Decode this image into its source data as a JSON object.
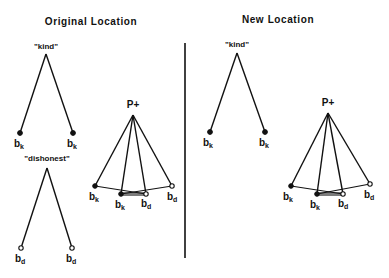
{
  "panels": {
    "left": {
      "title": "Original Location",
      "trees": [
        {
          "root_label": "\"kind\"",
          "leaves": [
            {
              "base": "b",
              "sub": "k",
              "marker": "filled"
            },
            {
              "base": "b",
              "sub": "k",
              "marker": "filled"
            }
          ]
        },
        {
          "root_label": "\"dishonest\"",
          "leaves": [
            {
              "base": "b",
              "sub": "d",
              "marker": "open"
            },
            {
              "base": "b",
              "sub": "d",
              "marker": "open"
            }
          ]
        },
        {
          "root_label": "P+",
          "leaves": [
            {
              "base": "b",
              "sub": "k",
              "marker": "filled"
            },
            {
              "base": "b",
              "sub": "k",
              "marker": "filled"
            },
            {
              "base": "b",
              "sub": "d",
              "marker": "open"
            },
            {
              "base": "b",
              "sub": "d",
              "marker": "open"
            }
          ]
        }
      ]
    },
    "right": {
      "title": "New Location",
      "trees": [
        {
          "root_label": "\"kind\"",
          "leaves": [
            {
              "base": "b",
              "sub": "k",
              "marker": "filled"
            },
            {
              "base": "b",
              "sub": "k",
              "marker": "filled"
            }
          ]
        },
        {
          "root_label": "P+",
          "leaves": [
            {
              "base": "b",
              "sub": "k",
              "marker": "filled"
            },
            {
              "base": "b",
              "sub": "k",
              "marker": "filled"
            },
            {
              "base": "b",
              "sub": "d",
              "marker": "open"
            },
            {
              "base": "b",
              "sub": "d",
              "marker": "open"
            }
          ]
        }
      ]
    }
  },
  "colors": {
    "ink": "#111111",
    "background": "#ffffff"
  }
}
